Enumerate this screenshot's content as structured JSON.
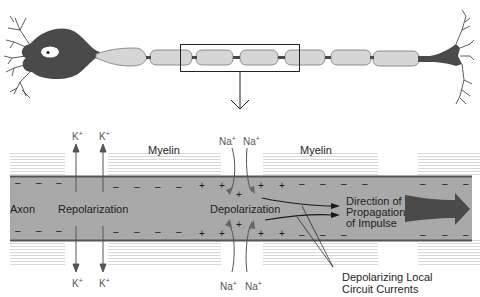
{
  "diagram": {
    "top_panel": {
      "description": "Neuron with cell body, myelinated axon segments and axon terminal",
      "zoom_box_label": "",
      "zoom_arrow": "down-arrow"
    },
    "labels": {
      "axon": "Axon",
      "myelin_left": "Myelin",
      "myelin_right": "Myelin",
      "repolarization": "Repolarization",
      "depolarization": "Depolarization",
      "direction_line1": "Direction of",
      "direction_line2": "Propagation",
      "direction_line3": "of Impulse",
      "currents_line1": "Depolarizing Local",
      "currents_line2": "Circuit Currents"
    },
    "ions": {
      "k": "K",
      "na": "Na",
      "plus": "+",
      "k_top_1": "K",
      "k_top_2": "K",
      "k_bottom_1": "K",
      "k_bottom_2": "K",
      "na_top_1": "Na",
      "na_top_2": "Na",
      "na_bottom_1": "Na",
      "na_bottom_2": "Na"
    },
    "charges": {
      "minus": "–",
      "plus": "+"
    },
    "colors": {
      "axon_fill": "#a9a9a9",
      "axon_border": "#5a5a5a",
      "myelin_stripe": "#dcdcdc",
      "soma": "#4a4a4a",
      "myelin_segment": "#d4d4d4",
      "arrow_big": "#4a4a4a"
    }
  }
}
